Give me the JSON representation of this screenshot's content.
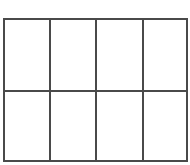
{
  "grid": {
    "rows": 2,
    "columns": 4,
    "line_color": "#4a4a4a",
    "background": "#ffffff"
  }
}
